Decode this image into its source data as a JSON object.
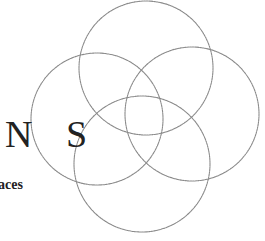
{
  "logo": {
    "title_letters": "N S",
    "subtitle_fragment": "aces",
    "text_color": "#222222",
    "circle_color": "#8a8a8a",
    "circles": [
      {
        "name": "top",
        "cx": 146,
        "cy": 68,
        "r": 67
      },
      {
        "name": "left",
        "cx": 97,
        "cy": 119,
        "r": 66
      },
      {
        "name": "right",
        "cx": 192,
        "cy": 114,
        "r": 67
      },
      {
        "name": "bottom",
        "cx": 142,
        "cy": 164,
        "r": 68
      }
    ]
  }
}
